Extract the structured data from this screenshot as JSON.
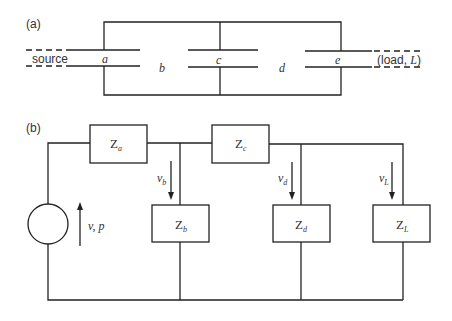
{
  "panel_a": {
    "label": "(a)",
    "source_label": "source",
    "load_label_open": "(load, ",
    "load_label_L": "L",
    "load_label_close": ")",
    "sections": [
      "a",
      "b",
      "c",
      "d",
      "e"
    ]
  },
  "panel_b": {
    "label": "(b)",
    "source": {
      "label": "v, p"
    },
    "series_impedances": [
      {
        "symbol": "Z",
        "sub": "a"
      },
      {
        "symbol": "Z",
        "sub": "c"
      }
    ],
    "shunt_impedances": [
      {
        "symbol": "Z",
        "sub": "b"
      },
      {
        "symbol": "Z",
        "sub": "d"
      },
      {
        "symbol": "Z",
        "sub": "L"
      }
    ],
    "voltages": [
      {
        "symbol": "v",
        "sub": "b"
      },
      {
        "symbol": "v",
        "sub": "d"
      },
      {
        "symbol": "v",
        "sub": "L"
      }
    ]
  }
}
